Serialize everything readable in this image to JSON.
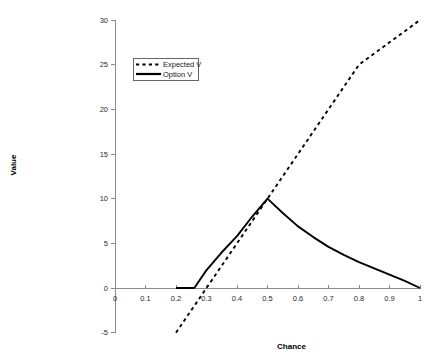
{
  "chart_data": {
    "type": "line",
    "title": "",
    "xlabel": "Chance",
    "ylabel": "Value",
    "xlim": [
      0,
      1
    ],
    "ylim": [
      -5,
      30
    ],
    "grid": false,
    "legend_position": "top-center-left",
    "xticks": [
      "0",
      "0.1",
      "0.2",
      "0.3",
      "0.4",
      "0.5",
      "0.6",
      "0.7",
      "0.8",
      "0.9",
      "1"
    ],
    "xtick_values": [
      0,
      0.1,
      0.2,
      0.3,
      0.4,
      0.5,
      0.6,
      0.7,
      0.8,
      0.9,
      1
    ],
    "yticks": [
      "-5",
      "0",
      "5",
      "10",
      "15",
      "20",
      "25",
      "30"
    ],
    "ytick_values": [
      -5,
      0,
      5,
      10,
      15,
      20,
      25,
      30
    ],
    "series": [
      {
        "name": "Expected V",
        "style": "dashed",
        "color": "#000000",
        "x": [
          0.2,
          0.26,
          0.3,
          0.4,
          0.5,
          0.6,
          0.7,
          0.8,
          0.9,
          1.0
        ],
        "values": [
          -5,
          -2,
          0,
          5,
          10,
          15,
          20,
          25,
          27.5,
          30
        ]
      },
      {
        "name": "Option V",
        "style": "solid",
        "color": "#000000",
        "x": [
          0.2,
          0.26,
          0.3,
          0.35,
          0.4,
          0.45,
          0.5,
          0.55,
          0.6,
          0.65,
          0.7,
          0.75,
          0.8,
          0.85,
          0.9,
          0.95,
          1.0
        ],
        "values": [
          0,
          0,
          2,
          4,
          5.8,
          8,
          10,
          8.4,
          6.9,
          5.7,
          4.6,
          3.7,
          2.9,
          2.2,
          1.5,
          0.8,
          0
        ]
      }
    ]
  },
  "legend": {
    "entries": [
      {
        "label": "Expected V"
      },
      {
        "label": "Option V"
      }
    ]
  }
}
